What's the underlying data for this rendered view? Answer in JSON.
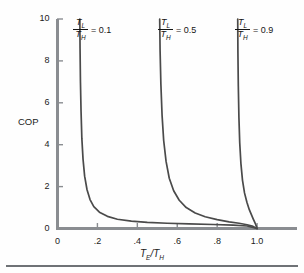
{
  "chart_data": {
    "type": "line",
    "title": "",
    "xlabel": "TE/TH",
    "ylabel": "COP",
    "xlim": [
      0,
      1.2
    ],
    "ylim": [
      0,
      10
    ],
    "xticks": [
      "0",
      ".2",
      ".4",
      ".6",
      ".8",
      "1.0"
    ],
    "xtick_values": [
      0,
      0.2,
      0.4,
      0.6,
      0.8,
      1.0
    ],
    "yticks": [
      "0",
      "2",
      "4",
      "6",
      "8",
      "10"
    ],
    "ytick_values": [
      0,
      2,
      4,
      6,
      8,
      10
    ],
    "grid": false,
    "legend": "inline-annotations",
    "line_color": "#4a4a4a",
    "axis_color": "#8a8d91",
    "series": [
      {
        "name": "TL/TH = 0.1",
        "ratio": 0.1,
        "asymptote_x": 0.11,
        "x": [
          0.112,
          0.113,
          0.115,
          0.118,
          0.122,
          0.128,
          0.136,
          0.148,
          0.163,
          0.182,
          0.21,
          0.25,
          0.3,
          0.37,
          0.45,
          0.55,
          0.66,
          0.78,
          0.88,
          0.95,
          1.0
        ],
        "y": [
          10.0,
          8.6,
          7.0,
          5.6,
          4.3,
          3.3,
          2.5,
          1.85,
          1.38,
          1.04,
          0.78,
          0.58,
          0.44,
          0.35,
          0.29,
          0.25,
          0.22,
          0.19,
          0.16,
          0.12,
          0.0
        ]
      },
      {
        "name": "TL/TH = 0.5",
        "ratio": 0.5,
        "asymptote_x": 0.51,
        "x": [
          0.512,
          0.514,
          0.518,
          0.524,
          0.532,
          0.544,
          0.56,
          0.582,
          0.61,
          0.645,
          0.69,
          0.74,
          0.8,
          0.86,
          0.91,
          0.95,
          0.98,
          1.0
        ],
        "y": [
          10.0,
          8.5,
          6.9,
          5.4,
          4.2,
          3.2,
          2.4,
          1.8,
          1.35,
          1.0,
          0.74,
          0.56,
          0.42,
          0.32,
          0.25,
          0.18,
          0.1,
          0.0
        ]
      },
      {
        "name": "TL/TH = 0.9",
        "ratio": 0.9,
        "asymptote_x": 0.902,
        "x": [
          0.903,
          0.904,
          0.906,
          0.909,
          0.913,
          0.919,
          0.927,
          0.937,
          0.949,
          0.961,
          0.972,
          0.981,
          0.988,
          0.993,
          0.997,
          1.0
        ],
        "y": [
          10.0,
          8.4,
          6.8,
          5.3,
          4.1,
          3.1,
          2.3,
          1.7,
          1.25,
          0.9,
          0.65,
          0.45,
          0.3,
          0.19,
          0.09,
          0.0
        ]
      }
    ],
    "annotations": [
      {
        "id": "label-0-1",
        "numerator": "T",
        "numerator_sub": "L",
        "denominator": "T",
        "denominator_sub": "H",
        "equals": "= 0.1",
        "value": "0.1"
      },
      {
        "id": "label-0-5",
        "numerator": "T",
        "numerator_sub": "L",
        "denominator": "T",
        "denominator_sub": "H",
        "equals": "= 0.5",
        "value": "0.5"
      },
      {
        "id": "label-0-9",
        "numerator": "T",
        "numerator_sub": "L",
        "denominator": "T",
        "denominator_sub": "H",
        "equals": "= 0.9",
        "value": "0.9"
      }
    ],
    "axis_label_x": {
      "numerator": "T",
      "numerator_sub": "E",
      "slash": "/",
      "denominator": "T",
      "denominator_sub": "H"
    }
  }
}
